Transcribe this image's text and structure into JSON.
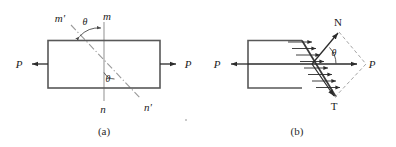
{
  "figure": {
    "panels": [
      {
        "id": "a",
        "caption": "(a)",
        "description": "Prismatic bar in tension with cut planes mn and m'n'",
        "labels": {
          "load_left": "P",
          "load_right": "P",
          "plane_normal_top": "m",
          "plane_normal_bottom": "n",
          "plane_inclined_top": "m'",
          "plane_inclined_bottom": "n'",
          "angle_top": "θ",
          "angle_inside": "θ"
        }
      },
      {
        "id": "b",
        "caption": "(b)",
        "description": "Free body of left segment showing resultant P resolved into normal force N and shear force T",
        "labels": {
          "load_left": "P",
          "resultant_right": "P",
          "normal_force": "N",
          "shear_force": "T",
          "angle": "θ"
        }
      }
    ],
    "colors": {
      "body_outline": "#585858",
      "body_outline_dark": "#3a3a3a",
      "construction_line": "#9a9a9a",
      "dashed_line": "#a5a5a5",
      "arrow": "#2b2b2b",
      "text": "#1b1b1b",
      "background": "#ffffff"
    }
  }
}
